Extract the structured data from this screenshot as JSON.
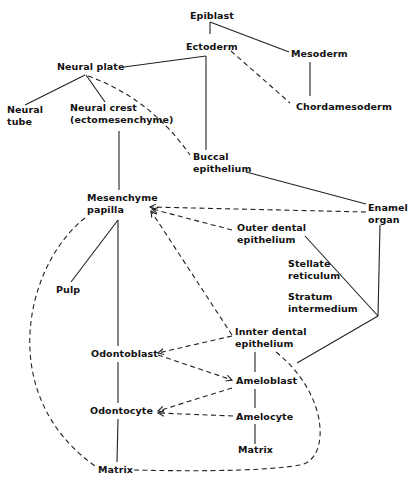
{
  "diagram": {
    "type": "developmental lineage diagram (tooth development)",
    "nodes": {
      "epiblast": {
        "lines": [
          "Epiblast"
        ]
      },
      "ectoderm": {
        "lines": [
          "Ectoderm"
        ]
      },
      "mesoderm": {
        "lines": [
          "Mesoderm"
        ]
      },
      "chordamesoderm": {
        "lines": [
          "Chordamesoderm"
        ]
      },
      "neural_plate": {
        "lines": [
          "Neural plate"
        ]
      },
      "neural_tube": {
        "lines": [
          "Neural",
          "tube"
        ]
      },
      "neural_crest": {
        "lines": [
          "Neural crest",
          "(ectomesenchyme)"
        ]
      },
      "buccal_epithelium": {
        "lines": [
          "Buccal",
          "epithelium"
        ]
      },
      "mesenchyme_papilla": {
        "lines": [
          "Mesenchyme",
          "papilla"
        ]
      },
      "enamel_organ": {
        "lines": [
          "Enamel",
          "organ"
        ]
      },
      "outer_dental_epithelium": {
        "lines": [
          "Outer dental",
          "epithelium"
        ]
      },
      "stellate_reticulum": {
        "lines": [
          "Stellate",
          "reticulum"
        ]
      },
      "stratum_intermedium": {
        "lines": [
          "Stratum",
          "intermedium"
        ]
      },
      "pulp": {
        "lines": [
          "Pulp"
        ]
      },
      "inner_dental_epithelium": {
        "lines": [
          "Innter dental",
          "epithelium"
        ]
      },
      "odontoblast": {
        "lines": [
          "Odontoblast"
        ]
      },
      "ameloblast": {
        "lines": [
          "Ameloblast"
        ]
      },
      "odontocyte": {
        "lines": [
          "Odontocyte"
        ]
      },
      "amelocyte": {
        "lines": [
          "Amelocyte"
        ]
      },
      "matrix_dentin": {
        "lines": [
          "Matrix"
        ]
      },
      "matrix_enamel": {
        "lines": [
          "Matrix"
        ]
      }
    },
    "edges": [
      {
        "from": "Epiblast",
        "to": "Ectoderm",
        "style": "solid"
      },
      {
        "from": "Epiblast",
        "to": "Mesoderm",
        "style": "solid"
      },
      {
        "from": "Mesoderm",
        "to": "Chordamesoderm",
        "style": "solid"
      },
      {
        "from": "Ectoderm",
        "to": "Chordamesoderm",
        "style": "dashed"
      },
      {
        "from": "Ectoderm",
        "to": "Neural plate",
        "style": "solid"
      },
      {
        "from": "Ectoderm",
        "to": "Buccal epithelium",
        "style": "solid"
      },
      {
        "from": "Neural plate",
        "to": "Neural tube",
        "style": "solid"
      },
      {
        "from": "Neural plate",
        "to": "Neural crest",
        "style": "solid"
      },
      {
        "from": "Neural plate",
        "to": "Buccal epithelium",
        "style": "dashed"
      },
      {
        "from": "Neural crest",
        "to": "Mesenchyme papilla",
        "style": "solid"
      },
      {
        "from": "Buccal epithelium",
        "to": "Enamel organ",
        "style": "solid"
      },
      {
        "from": "Enamel organ",
        "to": "Mesenchyme papilla",
        "style": "dashed-arrow"
      },
      {
        "from": "Outer dental epithelium",
        "to": "Mesenchyme papilla",
        "style": "dashed-arrow"
      },
      {
        "from": "Inner dental epithelium",
        "to": "Mesenchyme papilla",
        "style": "dashed-arrow"
      },
      {
        "from": "Mesenchyme papilla",
        "to": "Pulp",
        "style": "solid"
      },
      {
        "from": "Mesenchyme papilla",
        "to": "Odontoblast",
        "style": "solid"
      },
      {
        "from": "Mesenchyme papilla",
        "to": "Matrix (dentin)",
        "style": "dashed-curve"
      },
      {
        "from": "Enamel organ",
        "to": "Outer/Inner dental epithelium junction",
        "style": "solid"
      },
      {
        "from": "Inner dental epithelium",
        "to": "Odontoblast",
        "style": "dashed-arrow"
      },
      {
        "from": "Odontoblast",
        "to": "Ameloblast",
        "style": "dashed-arrow"
      },
      {
        "from": "Ameloblast",
        "to": "Odontocyte",
        "style": "dashed-arrow"
      },
      {
        "from": "Amelocyte",
        "to": "Odontocyte",
        "style": "dashed-arrow"
      },
      {
        "from": "Inner dental epithelium",
        "to": "Ameloblast",
        "style": "solid"
      },
      {
        "from": "Ameloblast",
        "to": "Amelocyte",
        "style": "solid"
      },
      {
        "from": "Amelocyte",
        "to": "Matrix (enamel)",
        "style": "solid"
      },
      {
        "from": "Odontoblast",
        "to": "Odontocyte",
        "style": "solid"
      },
      {
        "from": "Odontocyte",
        "to": "Matrix (dentin)",
        "style": "solid"
      },
      {
        "from": "Inner dental epithelium",
        "to": "Matrix (dentin)",
        "style": "dashed-curve"
      }
    ]
  }
}
